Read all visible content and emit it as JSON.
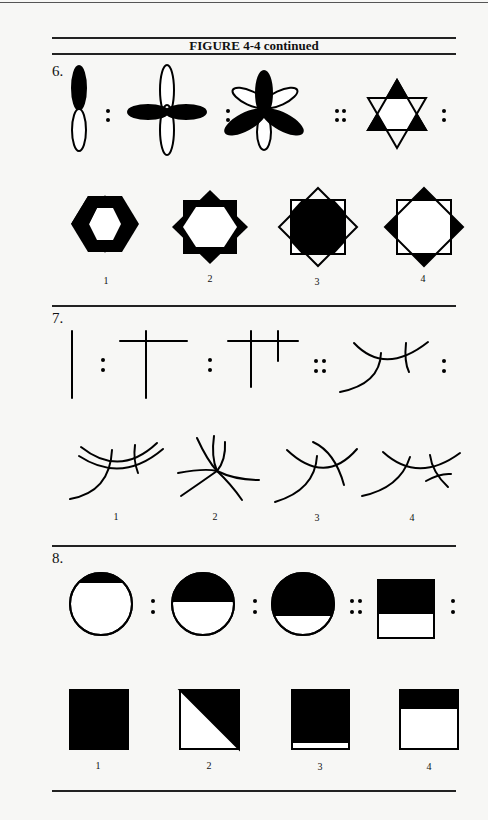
{
  "figure": {
    "title": "FIGURE 4-4 continued"
  },
  "questions": [
    {
      "number": "6.",
      "stem_separators": [
        ":",
        ":",
        "::",
        ":"
      ],
      "options": [
        "1",
        "2",
        "3",
        "4"
      ],
      "stem_figures": [
        "vertical two-petal ellipse, upper filled",
        "four-petal cross, horizontal filled",
        "five-petal flower, three filled",
        "six-point star, three points filled"
      ],
      "option_figures": [
        "six-point star, all points filled",
        "eight-point star, all points filled",
        "square over diamond, center filled",
        "eight-point star, four points filled"
      ]
    },
    {
      "number": "7.",
      "stem_separators": [
        ":",
        ":",
        "::",
        ":"
      ],
      "options": [
        "1",
        "2",
        "3",
        "4"
      ],
      "stem_figures": [
        "vertical line",
        "inverted T",
        "line with two crossbars",
        "curves with two crossings"
      ],
      "option_figures": [
        "double arcs crossed",
        "six arcs meeting at point",
        "arcs with a crescent",
        "arcs with extra cross"
      ]
    },
    {
      "number": "8.",
      "stem_separators": [
        ":",
        ":",
        "::",
        ":"
      ],
      "options": [
        "1",
        "2",
        "3",
        "4"
      ],
      "stem_figures": [
        "circle top sliver filled",
        "circle half filled",
        "circle mostly filled",
        "square top half filled"
      ],
      "option_figures": [
        "square fully filled",
        "square diagonal half filled",
        "square mostly filled",
        "square top sliver filled"
      ]
    }
  ]
}
